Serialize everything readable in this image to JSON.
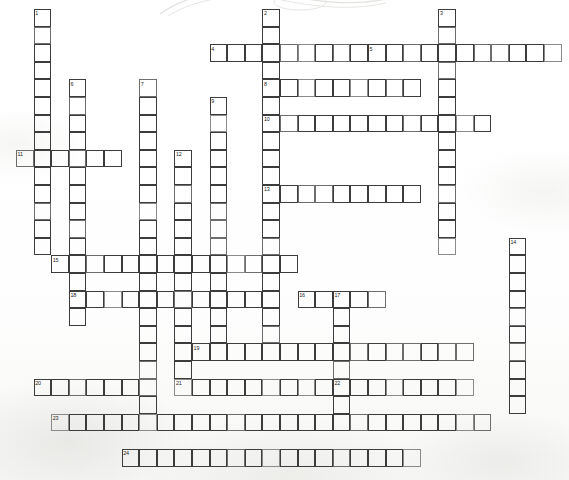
{
  "document": {
    "type": "crossword-puzzle-grid",
    "title": "Crossword Puzzle",
    "cell_size_px": 17.6,
    "origin_x_px": 16.0,
    "origin_y_px": 9.0,
    "ink_color": "#3c3c3c",
    "paper_color": "#fdfdfc",
    "number_color": "#1d1d1d"
  },
  "grid": {
    "columns": 32,
    "rows": 27,
    "note": "Coordinates are zero-based column/row indices from the grid origin."
  },
  "entries": [
    {
      "number": "1",
      "direction": "down",
      "col": 1,
      "row": 0,
      "length": 14
    },
    {
      "number": "2",
      "direction": "down",
      "col": 14,
      "row": 0,
      "length": 19
    },
    {
      "number": "3",
      "direction": "down",
      "col": 24,
      "row": 0,
      "length": 14
    },
    {
      "number": "4",
      "direction": "across",
      "col": 11,
      "row": 2,
      "length": 9
    },
    {
      "number": "5",
      "direction": "across",
      "col": 20,
      "row": 2,
      "length": 11
    },
    {
      "number": "6",
      "direction": "down",
      "col": 3,
      "row": 4,
      "length": 14
    },
    {
      "number": "7",
      "direction": "down",
      "col": 7,
      "row": 4,
      "length": 19
    },
    {
      "number": "8",
      "direction": "across",
      "col": 14,
      "row": 4,
      "length": 9
    },
    {
      "number": "9",
      "direction": "down",
      "col": 11,
      "row": 5,
      "length": 15
    },
    {
      "number": "10",
      "direction": "across",
      "col": 14,
      "row": 6,
      "length": 13
    },
    {
      "number": "11",
      "direction": "across",
      "col": 0,
      "row": 8,
      "length": 6
    },
    {
      "number": "12",
      "direction": "down",
      "col": 9,
      "row": 8,
      "length": 13
    },
    {
      "number": "13",
      "direction": "across",
      "col": 14,
      "row": 10,
      "length": 9
    },
    {
      "number": "14",
      "direction": "down",
      "col": 28,
      "row": 13,
      "length": 10
    },
    {
      "number": "15",
      "direction": "across",
      "col": 2,
      "row": 14,
      "length": 14
    },
    {
      "number": "16",
      "direction": "across",
      "col": 16,
      "row": 16,
      "length": 5
    },
    {
      "number": "17",
      "direction": "down",
      "col": 18,
      "row": 16,
      "length": 7
    },
    {
      "number": "18",
      "direction": "across",
      "col": 3,
      "row": 16,
      "length": 12
    },
    {
      "number": "19",
      "direction": "across",
      "col": 10,
      "row": 19,
      "length": 16
    },
    {
      "number": "20",
      "direction": "across",
      "col": 1,
      "row": 21,
      "length": 6
    },
    {
      "number": "21",
      "direction": "across",
      "col": 9,
      "row": 21,
      "length": 9
    },
    {
      "number": "22",
      "direction": "across",
      "col": 18,
      "row": 21,
      "length": 8
    },
    {
      "number": "23",
      "direction": "across",
      "col": 2,
      "row": 23,
      "length": 25
    },
    {
      "number": "24",
      "direction": "across",
      "col": 6,
      "row": 25,
      "length": 17
    }
  ],
  "clue_numbers": [
    "1",
    "2",
    "3",
    "4",
    "5",
    "6",
    "7",
    "8",
    "9",
    "10",
    "11",
    "12",
    "13",
    "14",
    "15",
    "16",
    "17",
    "18",
    "19",
    "20",
    "21",
    "22",
    "23",
    "24"
  ]
}
